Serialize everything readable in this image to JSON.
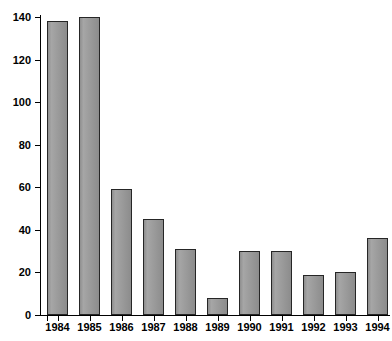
{
  "chart_data": {
    "type": "bar",
    "title": "",
    "xlabel": "",
    "ylabel": "",
    "categories": [
      "1984",
      "1985",
      "1986",
      "1987",
      "1988",
      "1989",
      "1990",
      "1991",
      "1992",
      "1993",
      "1994"
    ],
    "values": [
      138,
      140,
      59,
      45,
      31,
      8,
      30,
      30,
      19,
      20,
      36
    ],
    "ylim": [
      0,
      140
    ],
    "ytick_labels": [
      "0",
      "20",
      "40",
      "60",
      "80",
      "100",
      "120",
      "140"
    ],
    "ytick_values": [
      0,
      20,
      40,
      60,
      80,
      100,
      120,
      140
    ],
    "grid": false,
    "legend": false,
    "series": [
      {
        "name": "",
        "values": [
          138,
          140,
          59,
          45,
          31,
          8,
          30,
          30,
          19,
          20,
          36
        ]
      }
    ],
    "bar_fill_color": "#9b9b9b",
    "bar_border_color": "#262626",
    "axis_color": "#000000",
    "background_color": "#ffffff"
  }
}
